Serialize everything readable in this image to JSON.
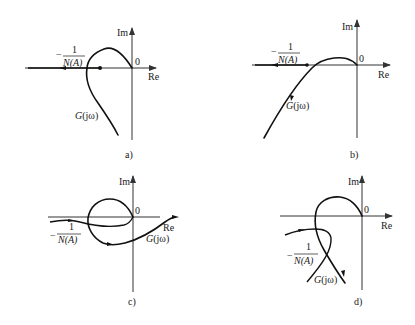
{
  "figure": {
    "type": "nyquist-describing-function-diagrams",
    "axis_labels": {
      "imag": "Im",
      "real": "Re",
      "origin": "0"
    },
    "curve_labels": {
      "g": "G(jω)",
      "g_G": "G",
      "g_rest": "(jω)"
    },
    "neg_inv_n": {
      "minus": "−",
      "numerator": "1",
      "denominator": "N(A)"
    },
    "panels": [
      {
        "id": "a",
        "caption": "a)"
      },
      {
        "id": "b",
        "caption": "b)"
      },
      {
        "id": "c",
        "caption": "c)"
      },
      {
        "id": "d",
        "caption": "d)"
      }
    ]
  },
  "colors": {
    "line": "#111111",
    "axis": "#333333",
    "background": "#ffffff"
  }
}
